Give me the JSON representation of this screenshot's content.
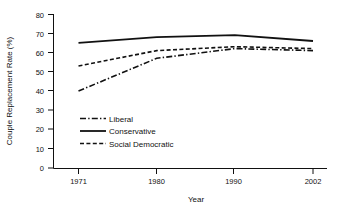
{
  "chart_data": {
    "type": "line",
    "title": "",
    "xlabel": "Year",
    "ylabel": "Couple Replacement Rate (%)",
    "x": [
      1971,
      1980,
      1990,
      2002
    ],
    "xtick_labels": [
      "1971",
      "1980",
      "1990",
      "2002"
    ],
    "ytick_labels": [
      "0",
      "10",
      "20",
      "30",
      "40",
      "50",
      "60",
      "70",
      "80"
    ],
    "yticks": [
      0,
      10,
      20,
      30,
      40,
      50,
      60,
      70,
      80
    ],
    "ylim": [
      0,
      80
    ],
    "xlim": [
      1971,
      2002
    ],
    "grid": false,
    "legend_position": "inside-lower-left",
    "series": [
      {
        "name": "Liberal",
        "style": "dash-dot",
        "color": "#111111",
        "values": [
          40,
          57,
          62,
          61
        ]
      },
      {
        "name": "Conservative",
        "style": "solid",
        "color": "#111111",
        "values": [
          65,
          68,
          69,
          66
        ]
      },
      {
        "name": "Social Democratic",
        "style": "dashed",
        "color": "#111111",
        "values": [
          53,
          61,
          63,
          62
        ]
      }
    ]
  },
  "axes": {
    "ylabel": "Couple Replacement Rate (%)",
    "xlabel": "Year"
  },
  "yticks": [
    {
      "label": "80"
    },
    {
      "label": "70"
    },
    {
      "label": "60"
    },
    {
      "label": "50"
    },
    {
      "label": "40"
    },
    {
      "label": "30"
    },
    {
      "label": "20"
    },
    {
      "label": "10"
    },
    {
      "label": "0"
    }
  ],
  "xticks": [
    {
      "label": "1971"
    },
    {
      "label": "1980"
    },
    {
      "label": "1990"
    },
    {
      "label": "2002"
    }
  ],
  "legend": {
    "items": [
      {
        "label": "Liberal"
      },
      {
        "label": "Conservative"
      },
      {
        "label": "Social Democratic"
      }
    ]
  }
}
